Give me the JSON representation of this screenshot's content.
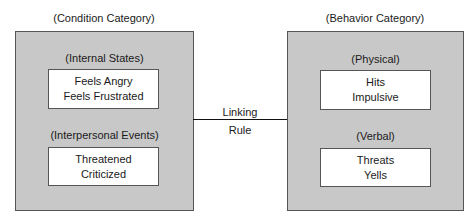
{
  "left": {
    "title": "(Condition Category)",
    "groups": [
      {
        "label": "(Internal States)",
        "items": [
          "Feels Angry",
          "Feels Frustrated"
        ]
      },
      {
        "label": "(Interpersonal Events)",
        "items": [
          "Threatened",
          "Criticized"
        ]
      }
    ]
  },
  "right": {
    "title": "(Behavior Category)",
    "groups": [
      {
        "label": "(Physical)",
        "items": [
          "Hits",
          "Impulsive"
        ]
      },
      {
        "label": "(Verbal)",
        "items": [
          "Threats",
          "Yells"
        ]
      }
    ]
  },
  "link": {
    "line1": "Linking",
    "line2": "Rule"
  }
}
